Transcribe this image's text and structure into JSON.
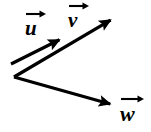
{
  "figure": {
    "background_color": "#ffffff",
    "stroke_color": "#000000",
    "stroke_width": 3.2
  },
  "labels": {
    "u": "u",
    "v": "v",
    "w": "w"
  },
  "chart_data": {
    "type": "diagram",
    "title": "",
    "xlabel": "",
    "ylabel": "",
    "coordinate_system": "pixels, origin top-left, y increases downward",
    "width": 151,
    "height": 132,
    "vectors": [
      {
        "name": "u",
        "label": "u",
        "tail": [
          11,
          64
        ],
        "tip": [
          63,
          38
        ],
        "arrowhead": true,
        "label_position": [
          25,
          9
        ]
      },
      {
        "name": "v",
        "label": "v",
        "tail": [
          14,
          77
        ],
        "tip": [
          114,
          18
        ],
        "arrowhead": true,
        "label_position": [
          68,
          1
        ]
      },
      {
        "name": "w",
        "label": "w",
        "tail": [
          14,
          77
        ],
        "tip": [
          114,
          105
        ],
        "arrowhead": true,
        "label_position": [
          120,
          94
        ]
      }
    ]
  }
}
